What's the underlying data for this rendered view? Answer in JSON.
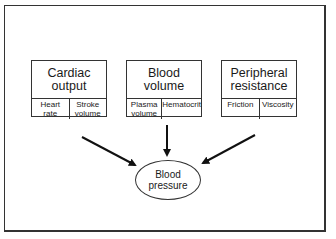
{
  "diagram": {
    "factors": [
      {
        "title": "Cardiac output",
        "title_lines": [
          "Cardiac",
          "output"
        ],
        "components": [
          {
            "label": "Heart rate",
            "lines": [
              "Heart",
              "rate"
            ]
          },
          {
            "label": "Stroke volume",
            "lines": [
              "Stroke",
              "volume"
            ]
          }
        ]
      },
      {
        "title": "Blood volume",
        "title_lines": [
          "Blood",
          "volume"
        ],
        "components": [
          {
            "label": "Plasma volume",
            "lines": [
              "Plasma",
              "volume"
            ]
          },
          {
            "label": "Hematocrit",
            "lines": [
              "Hematocrit"
            ]
          }
        ]
      },
      {
        "title": "Peripheral resistance",
        "title_lines": [
          "Peripheral",
          "resistance"
        ],
        "components": [
          {
            "label": "Friction",
            "lines": [
              "Friction"
            ]
          },
          {
            "label": "Viscosity",
            "lines": [
              "Viscosity"
            ]
          }
        ]
      }
    ],
    "outcome": {
      "label": "Blood pressure",
      "lines": [
        "Blood",
        "pressure"
      ]
    },
    "edges": [
      {
        "from": "Cardiac output",
        "to": "Blood pressure"
      },
      {
        "from": "Blood volume",
        "to": "Blood pressure"
      },
      {
        "from": "Peripheral resistance",
        "to": "Blood pressure"
      }
    ]
  }
}
